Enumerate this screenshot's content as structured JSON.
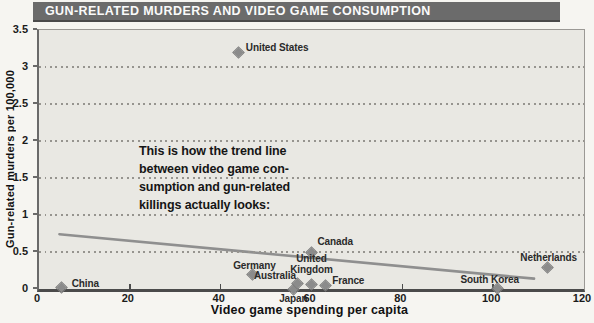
{
  "title_bar": {
    "text": "GUN-RELATED MURDERS AND VIDEO GAME CONSUMPTION"
  },
  "chart_data": {
    "type": "scatter",
    "title": "GUN-RELATED MURDERS AND VIDEO GAME CONSUMPTION",
    "xlabel": "Video game spending per capita",
    "ylabel": "Gun-related murders per 100,000",
    "xlim": [
      0,
      120
    ],
    "ylim": [
      0,
      3.5
    ],
    "x_ticks": [
      0,
      20,
      40,
      60,
      80,
      100,
      120
    ],
    "y_ticks": [
      0,
      0.5,
      1,
      1.5,
      2,
      2.5,
      3,
      3.5
    ],
    "grid": "horizontal dotted gridlines",
    "gridline_values": [
      0.5,
      1,
      1.5,
      2,
      2.5,
      3
    ],
    "legend": "none",
    "points": [
      {
        "label": "China",
        "x": 5,
        "y": 0.02,
        "anchor": "left",
        "dx": 10,
        "dy": -5
      },
      {
        "label": "United States",
        "x": 44,
        "y": 3.2,
        "anchor": "left",
        "dx": 7,
        "dy": -5
      },
      {
        "label": "Germany",
        "x": 47,
        "y": 0.19,
        "anchor": "center",
        "dx": 2,
        "dy": -10
      },
      {
        "label": "Japan",
        "x": 56,
        "y": 0.0,
        "anchor": "center",
        "dx": 0,
        "dy": 9
      },
      {
        "label": "Australia",
        "x": 57,
        "y": 0.07,
        "anchor": "right",
        "dx": -2,
        "dy": -9
      },
      {
        "label": "Canada",
        "x": 60,
        "y": 0.5,
        "anchor": "left",
        "dx": 6,
        "dy": -11
      },
      {
        "label": "United\nKingdom",
        "x": 60,
        "y": 0.06,
        "anchor": "center",
        "dx": 0,
        "dy": -21
      },
      {
        "label": "France",
        "x": 63,
        "y": 0.05,
        "anchor": "left",
        "dx": 7,
        "dy": -5
      },
      {
        "label": "South Korea",
        "x": 101,
        "y": 0.01,
        "anchor": "center",
        "dx": -8,
        "dy": -9
      },
      {
        "label": "Netherlands",
        "x": 112,
        "y": 0.29,
        "anchor": "center",
        "dx": 1,
        "dy": -11
      }
    ],
    "trend_line": {
      "x1": 4.5,
      "y1": 0.74,
      "x2": 109,
      "y2": 0.14
    },
    "annotation": "This is how the trend line\nbetween video game con-\nsumption and gun-related\nkillings actually looks:",
    "colors": {
      "title_bar_bg": "#6b6b6b",
      "title_text": "#fafafa",
      "plot_bg": "#e9e8e3",
      "page_bg": "#f6f5f1",
      "marker": "#8b8b8b",
      "trend_line": "#8f8f8f",
      "grid_dots": "#96948f",
      "axis": "#4b4b4b",
      "text": "#1b1b1b"
    }
  }
}
